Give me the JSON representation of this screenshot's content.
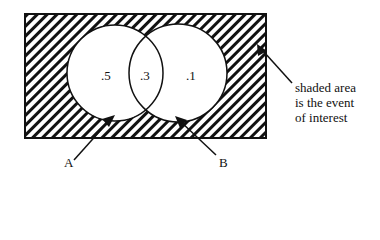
{
  "diagram": {
    "type": "venn",
    "sets": [
      {
        "name": "A",
        "only_value": ".5"
      },
      {
        "name": "B",
        "only_value": ".1"
      }
    ],
    "intersection_value": ".3",
    "shading": "complement of A union B (outside both circles)",
    "labels": {
      "a": "A",
      "b": "B"
    },
    "region_values": {
      "a_only": ".5",
      "a_and_b": ".3",
      "b_only": ".1"
    },
    "annotation_lines": [
      "shaded area",
      "is the event",
      "of interest"
    ],
    "colors": {
      "ink": "#111111",
      "background": "#ffffff"
    }
  }
}
